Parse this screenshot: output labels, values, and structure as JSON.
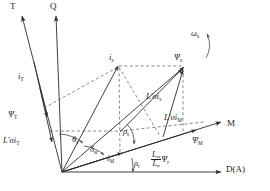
{
  "figure": {
    "type": "vector-phasor-diagram",
    "background": "#ffffff",
    "line_color": "#2b2b2b",
    "dash_color": "#555555"
  },
  "axes": [
    {
      "id": "T",
      "label": "T",
      "label_x": 10,
      "label_y": 3,
      "from": [
        62,
        129
      ],
      "to": [
        20,
        14
      ]
    },
    {
      "id": "Q",
      "label": "Q",
      "label_x": 50,
      "label_y": 3,
      "from": [
        62,
        129
      ],
      "to": [
        55,
        14
      ]
    },
    {
      "id": "M",
      "label": "M",
      "label_x": 227,
      "label_y": 124,
      "from": [
        62,
        172
      ],
      "to": [
        222,
        122
      ]
    },
    {
      "id": "D",
      "label": "D(A)",
      "label_x": 228,
      "label_y": 166,
      "from": [
        62,
        172
      ],
      "to": [
        222,
        172
      ]
    }
  ],
  "vectors": [
    {
      "id": "i_T",
      "label": "i",
      "sub": "T",
      "label_x": 18,
      "label_y": 76,
      "italic": true
    },
    {
      "id": "psi_T",
      "label": "Ψ",
      "sub": "T",
      "label_x": 9,
      "label_y": 114,
      "italic": true
    },
    {
      "id": "Lsig_i_T",
      "label": "L′σi",
      "sub": "T",
      "label_x": 4,
      "label_y": 140,
      "italic": true
    },
    {
      "id": "i_s",
      "label": "i",
      "sub": "s",
      "label_x": 110,
      "label_y": 57,
      "italic": true
    },
    {
      "id": "psi_s",
      "label": "Ψ",
      "sub": "s",
      "label_x": 175,
      "label_y": 57,
      "italic": true
    },
    {
      "id": "omega_s",
      "label": "ω",
      "sub": "s",
      "label_x": 192,
      "label_y": 32,
      "italic": true
    },
    {
      "id": "Lsig_i_s",
      "label": "L′σi",
      "sub": "s",
      "label_x": 147,
      "label_y": 96,
      "italic": true
    },
    {
      "id": "Lsig_i_M",
      "label": "L′σi",
      "sub": "M",
      "label_x": 165,
      "label_y": 117,
      "italic": true
    },
    {
      "id": "psi_M",
      "label": "Ψ",
      "sub": "M",
      "label_x": 193,
      "label_y": 140,
      "italic": true
    },
    {
      "id": "i_M",
      "label": "i",
      "sub": "M",
      "label_x": 108,
      "label_y": 158,
      "italic": true
    }
  ],
  "angles": [
    {
      "id": "theta_s",
      "label": "θ",
      "sub": "s",
      "label_x": 73,
      "label_y": 139
    },
    {
      "id": "delta_sr",
      "label": "δ",
      "sub": "sr",
      "label_x": 91,
      "label_y": 148
    },
    {
      "id": "rho_s",
      "label": "ρ",
      "sub": "s",
      "label_x": 124,
      "label_y": 131
    },
    {
      "id": "rho_r",
      "label": "ρ",
      "sub": "r",
      "label_x": 135,
      "label_y": 163
    }
  ],
  "expressions": [
    {
      "id": "Lm_over_Lsig_psi_r",
      "numerator": "L",
      "numerator_sub": "m",
      "denominator": "L",
      "denominator_sub": "σ",
      "trailing": "Ψ",
      "trailing_sub": "r",
      "label_x": 152,
      "label_y": 156
    }
  ]
}
